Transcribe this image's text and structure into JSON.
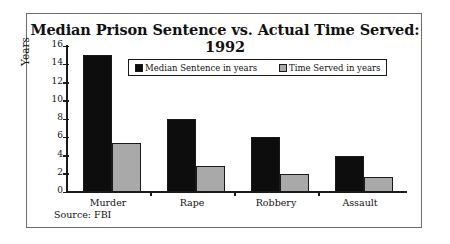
{
  "figure": {
    "source_note": "Source: FBI"
  },
  "chart_data": {
    "type": "bar",
    "title": "Median Prison Sentence vs. Actual Time Served: 1992",
    "xlabel": "",
    "ylabel": "Years",
    "ylim": [
      0,
      16
    ],
    "yticks": [
      0,
      2,
      4,
      6,
      8,
      10,
      12,
      14,
      16
    ],
    "ytick_labels": [
      "0",
      "2",
      "4",
      "6",
      "8",
      "10",
      "12",
      "14",
      "16"
    ],
    "grid": false,
    "legend_position": "upper center",
    "categories": [
      "Murder",
      "Rape",
      "Robbery",
      "Assault"
    ],
    "series": [
      {
        "name": "Median Sentence in years",
        "color": "#0d0d0d",
        "values": [
          15,
          8,
          6,
          4
        ]
      },
      {
        "name": "Time Served in years",
        "color": "#a9a9a9",
        "values": [
          5.4,
          2.8,
          2.0,
          1.6
        ]
      }
    ]
  }
}
